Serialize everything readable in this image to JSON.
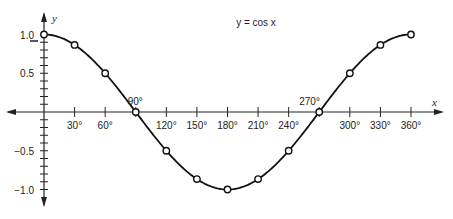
{
  "chart_data": {
    "type": "line",
    "title": "y = cos x",
    "xlabel": "x",
    "ylabel": "y",
    "x": [
      0,
      30,
      60,
      90,
      120,
      150,
      180,
      210,
      240,
      270,
      300,
      330,
      360
    ],
    "series": [
      {
        "name": "y = cos x",
        "values": [
          1.0,
          0.866,
          0.5,
          0.0,
          -0.5,
          -0.866,
          -1.0,
          -0.866,
          -0.5,
          0.0,
          0.5,
          0.866,
          1.0
        ],
        "markers": "open-circle",
        "line": "smooth"
      }
    ],
    "x_tick_labels": [
      "30°",
      "60°",
      "90°",
      "120°",
      "150°",
      "180°",
      "210°",
      "240°",
      "270°",
      "300°",
      "330°",
      "360°"
    ],
    "y_tick_labels": [
      "1.0",
      "0.5",
      "-0.5",
      "-1.0"
    ],
    "annotations": [
      "90°",
      "270°"
    ],
    "xlim": [
      0,
      360
    ],
    "ylim": [
      -1.0,
      1.0
    ],
    "grid": false,
    "legend": null
  },
  "colors": {
    "line": "#111111",
    "axis": "#222222",
    "background": "#ffffff"
  }
}
